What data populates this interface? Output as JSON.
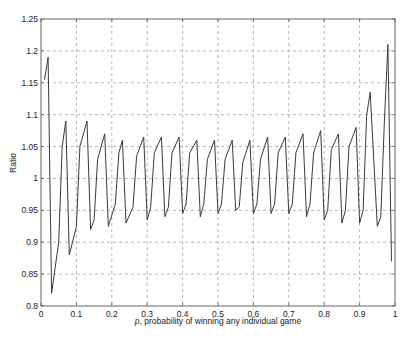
{
  "chart_data": {
    "type": "line",
    "title": "",
    "xlabel_italic": "p",
    "xlabel_rest": ", probability of winning any individual game",
    "xlabel": "p, probability of winning any individual game",
    "ylabel": "Ratio",
    "xlim": [
      0,
      1
    ],
    "ylim": [
      0.8,
      1.25
    ],
    "grid": true,
    "legend": "none",
    "xticks": [
      "0",
      "0.1",
      "0.2",
      "0.3",
      "0.4",
      "0.5",
      "0.6",
      "0.7",
      "0.8",
      "0.9",
      "1"
    ],
    "yticks": [
      "0.8",
      "0.85",
      "0.9",
      "0.95",
      "1",
      "1.05",
      "1.1",
      "1.15",
      "1.2",
      "1.25"
    ],
    "series": [
      {
        "name": "Ratio",
        "color": "#3a3a3a",
        "x": [
          0.01,
          0.02,
          0.03,
          0.05,
          0.06,
          0.07,
          0.08,
          0.1,
          0.11,
          0.13,
          0.14,
          0.15,
          0.16,
          0.18,
          0.19,
          0.21,
          0.22,
          0.23,
          0.24,
          0.26,
          0.27,
          0.29,
          0.3,
          0.31,
          0.32,
          0.34,
          0.35,
          0.36,
          0.37,
          0.39,
          0.4,
          0.41,
          0.42,
          0.44,
          0.45,
          0.46,
          0.47,
          0.49,
          0.5,
          0.51,
          0.52,
          0.54,
          0.55,
          0.56,
          0.57,
          0.59,
          0.6,
          0.61,
          0.62,
          0.64,
          0.65,
          0.66,
          0.67,
          0.69,
          0.7,
          0.71,
          0.72,
          0.74,
          0.75,
          0.76,
          0.77,
          0.79,
          0.8,
          0.81,
          0.82,
          0.84,
          0.85,
          0.86,
          0.87,
          0.89,
          0.9,
          0.91,
          0.92,
          0.93,
          0.95,
          0.96,
          0.97,
          0.98,
          0.99
        ],
        "y": [
          1.155,
          1.19,
          0.82,
          0.9,
          1.05,
          1.09,
          0.88,
          0.925,
          1.05,
          1.09,
          0.92,
          0.935,
          1.03,
          1.07,
          0.925,
          0.96,
          1.04,
          1.06,
          0.93,
          0.955,
          1.035,
          1.065,
          0.935,
          0.955,
          1.04,
          1.065,
          0.94,
          0.955,
          1.04,
          1.065,
          0.945,
          0.96,
          1.04,
          1.06,
          0.94,
          0.96,
          1.03,
          1.06,
          0.945,
          0.96,
          1.03,
          1.06,
          0.95,
          0.955,
          1.025,
          1.06,
          0.945,
          0.96,
          1.03,
          1.065,
          0.945,
          0.96,
          1.04,
          1.065,
          0.945,
          0.96,
          1.04,
          1.07,
          0.94,
          0.96,
          1.04,
          1.075,
          0.935,
          0.95,
          1.045,
          1.07,
          0.93,
          0.95,
          1.05,
          1.08,
          0.93,
          0.95,
          1.1,
          1.135,
          0.925,
          0.94,
          1.09,
          1.21,
          0.87
        ]
      }
    ]
  }
}
